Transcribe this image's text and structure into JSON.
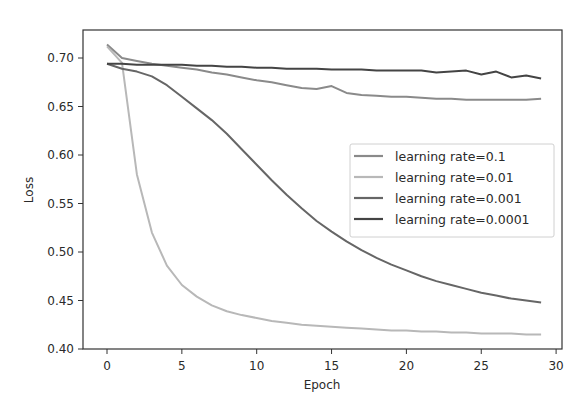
{
  "chart_data": {
    "type": "line",
    "title": "",
    "xlabel": "Epoch",
    "ylabel": "Loss",
    "xlim": [
      -1.5,
      30.4
    ],
    "ylim": [
      0.4,
      0.729
    ],
    "xticks": [
      0,
      5,
      10,
      15,
      20,
      25,
      30
    ],
    "xtick_labels": [
      "0",
      "5",
      "10",
      "15",
      "20",
      "25",
      "30"
    ],
    "yticks": [
      0.4,
      0.45,
      0.5,
      0.55,
      0.6,
      0.65,
      0.7
    ],
    "ytick_labels": [
      "0.40",
      "0.45",
      "0.50",
      "0.55",
      "0.60",
      "0.65",
      "0.70"
    ],
    "grid": false,
    "legend_position": "center right",
    "x": [
      0,
      1,
      2,
      3,
      4,
      5,
      6,
      7,
      8,
      9,
      10,
      11,
      12,
      13,
      14,
      15,
      16,
      17,
      18,
      19,
      20,
      21,
      22,
      23,
      24,
      25,
      26,
      27,
      28,
      29
    ],
    "series": [
      {
        "name": "learning rate=0.1",
        "color": "#8a8a8a",
        "values": [
          0.714,
          0.7,
          0.697,
          0.694,
          0.692,
          0.69,
          0.688,
          0.685,
          0.683,
          0.68,
          0.677,
          0.675,
          0.672,
          0.669,
          0.668,
          0.671,
          0.664,
          0.662,
          0.661,
          0.66,
          0.66,
          0.659,
          0.658,
          0.658,
          0.657,
          0.657,
          0.657,
          0.657,
          0.657,
          0.658
        ]
      },
      {
        "name": "learning rate=0.01",
        "color": "#b8b8b8",
        "values": [
          0.712,
          0.695,
          0.58,
          0.52,
          0.486,
          0.466,
          0.454,
          0.445,
          0.439,
          0.435,
          0.432,
          0.429,
          0.427,
          0.425,
          0.424,
          0.423,
          0.422,
          0.421,
          0.42,
          0.419,
          0.419,
          0.418,
          0.418,
          0.417,
          0.417,
          0.416,
          0.416,
          0.416,
          0.415,
          0.415
        ]
      },
      {
        "name": "learning rate=0.001",
        "color": "#666666",
        "values": [
          0.694,
          0.689,
          0.686,
          0.681,
          0.672,
          0.66,
          0.648,
          0.636,
          0.622,
          0.606,
          0.59,
          0.574,
          0.559,
          0.545,
          0.532,
          0.521,
          0.511,
          0.502,
          0.494,
          0.487,
          0.481,
          0.475,
          0.47,
          0.466,
          0.462,
          0.458,
          0.455,
          0.452,
          0.45,
          0.448
        ]
      },
      {
        "name": "learning rate=0.0001",
        "color": "#444444",
        "values": [
          0.694,
          0.694,
          0.693,
          0.693,
          0.693,
          0.693,
          0.692,
          0.692,
          0.691,
          0.691,
          0.69,
          0.69,
          0.689,
          0.689,
          0.689,
          0.688,
          0.688,
          0.688,
          0.687,
          0.687,
          0.687,
          0.687,
          0.685,
          0.686,
          0.687,
          0.683,
          0.686,
          0.68,
          0.682,
          0.679
        ]
      }
    ]
  }
}
